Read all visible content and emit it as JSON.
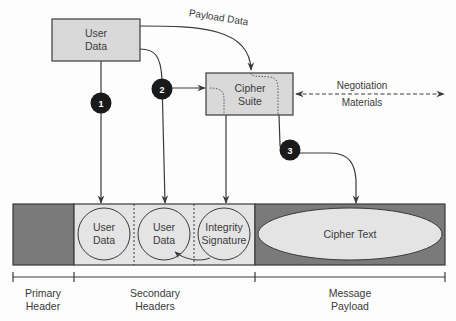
{
  "boxes": {
    "user_data": {
      "line1": "User",
      "line2": "Data"
    },
    "cipher_suite": {
      "line1": "Cipher",
      "line2": "Suite"
    }
  },
  "labels": {
    "payload_data": "Payload Data",
    "negotiation_line1": "Negotiation",
    "negotiation_line2": "Materials"
  },
  "badges": [
    "1",
    "2",
    "3"
  ],
  "message": {
    "secondary_cells": [
      {
        "line1": "User",
        "line2": "Data"
      },
      {
        "line1": "User",
        "line2": "Data"
      },
      {
        "line1": "Integrity",
        "line2": "Signature"
      }
    ],
    "payload": "Cipher Text"
  },
  "sections": {
    "primary": {
      "line1": "Primary",
      "line2": "Header"
    },
    "secondary": {
      "line1": "Secondary",
      "line2": "Headers"
    },
    "payload": {
      "line1": "Message",
      "line2": "Payload"
    }
  },
  "colors": {
    "box_fill": "#d9d9d9",
    "dark_fill": "#7a7a7a",
    "light_fill": "#e4e4e4",
    "stroke": "#3a3a3a",
    "badge": "#1a1a1a"
  }
}
